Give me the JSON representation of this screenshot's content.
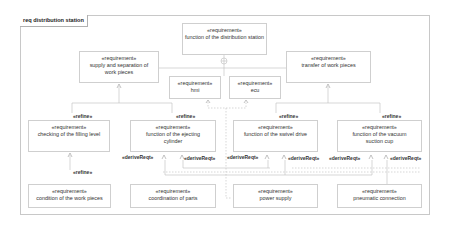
{
  "diagram": {
    "frame_title": "req distribution station",
    "stereotype": "«requirement»",
    "requirements": {
      "top": "function of the distribution station",
      "supply": "supply and separation of work pieces",
      "transfer": "transfer of work pieces",
      "hmi": "hmi",
      "ecu": "ecu",
      "checking": "checking of the filling level",
      "ejecting": "function of the ejecting cylinder",
      "swivel": "function of the swivel drive",
      "vacuum": "function of the vacuum suction cup",
      "condition": "condition of the work pieces",
      "coordination": "coordination of parts",
      "power": "power supply",
      "pneumatic": "pneumatic connection"
    },
    "relations": {
      "refine": "«refine»",
      "derive": "«deriveReqt»"
    },
    "colors": {
      "border": "#cfcfcf",
      "line": "#bdbdbd",
      "text": "#333333"
    }
  }
}
